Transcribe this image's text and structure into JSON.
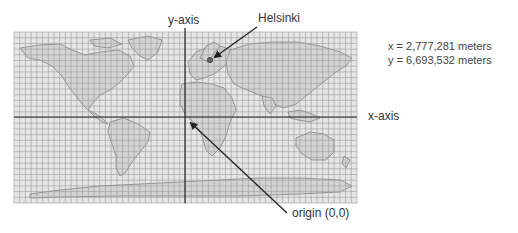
{
  "figure": {
    "map": {
      "left": 14,
      "top": 32,
      "width": 343,
      "height": 171,
      "grid_columns": 60,
      "grid_rows": 30,
      "grid_color": "#9a9a9a",
      "background_color": "#e4e4e4",
      "coastline_color": "#7a7a7a"
    },
    "axes": {
      "y_axis": {
        "label": "y-axis",
        "x": 185
      },
      "x_axis": {
        "label": "x-axis",
        "y": 117
      },
      "color": "#222222"
    },
    "annotations": {
      "helsinki": {
        "label": "Helsinki",
        "point_x": 210,
        "point_y": 60
      },
      "origin": {
        "label": "origin (0,0)"
      }
    },
    "coordinates": {
      "x_line": "x = 2,777,281 meters",
      "y_line": "y = 6,693,532 meters"
    }
  }
}
